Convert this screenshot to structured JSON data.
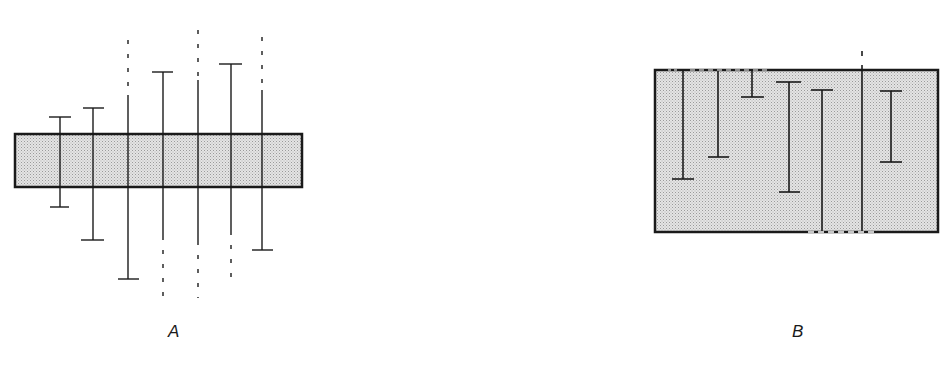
{
  "figure": {
    "panels": [
      {
        "id": "A",
        "label": "A",
        "description": "Thin horizontal stippled slab pierced by vertical line segments (bars). Solid segments end in T-caps; dashed segments extend beyond the drawing.",
        "slab": {
          "x": 15,
          "y": 134,
          "width": 287,
          "height": 53,
          "fill": "#dcdcdc",
          "stroke": "#1a1a1a"
        },
        "bars": [
          {
            "x": 60,
            "top": 117,
            "bottom": 207,
            "top_cap": true,
            "bottom_cap": true,
            "dashed_top": false,
            "dashed_bottom": false
          },
          {
            "x": 93,
            "top": 108,
            "bottom": 240,
            "top_cap": true,
            "bottom_cap": true,
            "dashed_top": false,
            "dashed_bottom": false
          },
          {
            "x": 128,
            "top": 30,
            "bottom": 279,
            "top_cap": false,
            "bottom_cap": true,
            "dashed_top": true,
            "dashed_bottom": false
          },
          {
            "x": 163,
            "top": 72,
            "bottom": 298,
            "top_cap": true,
            "bottom_cap": false,
            "dashed_top": false,
            "dashed_bottom": true
          },
          {
            "x": 198,
            "top": 20,
            "bottom": 298,
            "top_cap": false,
            "bottom_cap": false,
            "dashed_top": true,
            "dashed_bottom": true
          },
          {
            "x": 231,
            "top": 64,
            "bottom": 285,
            "top_cap": true,
            "bottom_cap": false,
            "dashed_top": false,
            "dashed_bottom": true
          },
          {
            "x": 262,
            "top": 27,
            "bottom": 250,
            "top_cap": false,
            "bottom_cap": true,
            "dashed_top": true,
            "dashed_bottom": false
          }
        ]
      },
      {
        "id": "B",
        "label": "B",
        "description": "Thick stippled slab containing vertical line segments; some segments touch the top or bottom surface, which is broken where they exit.",
        "slab": {
          "x": 655,
          "y": 70,
          "width": 283,
          "height": 162,
          "fill": "#dcdcdc",
          "stroke": "#1a1a1a"
        },
        "bars": [
          {
            "x": 683,
            "top": 71,
            "bottom": 179,
            "top_cap": false,
            "bottom_cap": true
          },
          {
            "x": 718,
            "top": 71,
            "bottom": 157,
            "top_cap": false,
            "bottom_cap": true
          },
          {
            "x": 752,
            "top": 71,
            "bottom": 97,
            "top_cap": false,
            "bottom_cap": true
          },
          {
            "x": 789,
            "top": 82,
            "bottom": 192,
            "top_cap": true,
            "bottom_cap": true
          },
          {
            "x": 822,
            "top": 90,
            "bottom": 231,
            "top_cap": true,
            "bottom_cap": false
          },
          {
            "x": 862,
            "top": 42,
            "bottom": 231,
            "top_cap": false,
            "bottom_cap": false,
            "dashed_top": true
          },
          {
            "x": 891,
            "top": 91,
            "bottom": 162,
            "top_cap": true,
            "bottom_cap": true
          }
        ]
      }
    ]
  }
}
